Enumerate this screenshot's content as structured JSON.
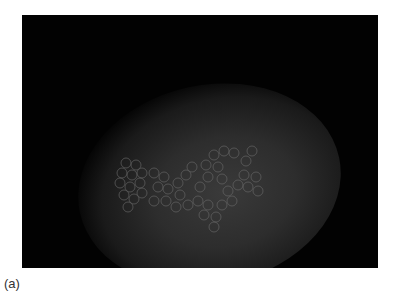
{
  "figure": {
    "caption": "(a)",
    "colors": {
      "background": "#020202",
      "blob": "#3a3a3a",
      "circles": "#6a6a6a",
      "page": "#ffffff"
    }
  }
}
